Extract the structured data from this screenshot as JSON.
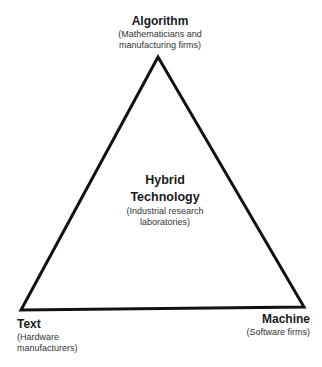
{
  "diagram": {
    "shape": "triangle",
    "line_color": "#111111",
    "vertices": {
      "top": {
        "title": "Algorithm",
        "subtitle_line1": "(Mathematicians and",
        "subtitle_line2": "manufacturing firms)"
      },
      "bottom_left": {
        "title": "Text",
        "subtitle_line1": "(Hardware",
        "subtitle_line2": "manufacturers)"
      },
      "bottom_right": {
        "title": "Machine",
        "subtitle_line1": "(Software firms)"
      }
    },
    "center": {
      "title_line1": "Hybrid",
      "title_line2": "Technology",
      "subtitle_line1": "(Industrial research",
      "subtitle_line2": "laboratories)"
    }
  }
}
